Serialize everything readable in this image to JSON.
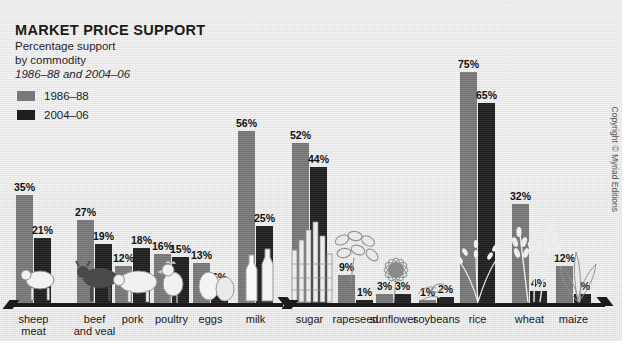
{
  "header": {
    "title": "MARKET PRICE SUPPORT",
    "subtitle_line1": "Percentage support",
    "subtitle_line2": "by commodity",
    "subtitle_line3": "1986–88 and 2004–06"
  },
  "legend": {
    "entries": [
      {
        "label": "1986–88",
        "color": "#797979"
      },
      {
        "label": "2004–06",
        "color": "#1f1f1f"
      }
    ]
  },
  "copyright": "Copyright © Myriad Editions",
  "chart_data": {
    "type": "bar",
    "title": "MARKET PRICE SUPPORT",
    "subtitle": "Percentage support by commodity, 1986–88 and 2004–06",
    "xlabel": "",
    "ylabel": "Percentage support",
    "ylim": [
      0,
      75
    ],
    "grid": false,
    "legend_position": "top-left",
    "unit": "%",
    "categories": [
      "sheep meat",
      "beef and veal",
      "pork",
      "poultry",
      "eggs",
      "milk",
      "sugar",
      "rapeseed",
      "sunflower",
      "soybeans",
      "rice",
      "wheat",
      "maize"
    ],
    "series": [
      {
        "name": "1986–88",
        "color": "#797979",
        "values": [
          35,
          27,
          12,
          16,
          13,
          56,
          52,
          9,
          3,
          1,
          75,
          32,
          12
        ]
      },
      {
        "name": "2004–06",
        "color": "#1f1f1f",
        "values": [
          21,
          19,
          18,
          15,
          6,
          25,
          44,
          1,
          3,
          2,
          65,
          4,
          3
        ]
      }
    ],
    "value_labels": [
      [
        "35%",
        "21%"
      ],
      [
        "27%",
        "19%"
      ],
      [
        "12%",
        "18%"
      ],
      [
        "16%",
        "15%"
      ],
      [
        "13%",
        "6%"
      ],
      [
        "56%",
        "25%"
      ],
      [
        "52%",
        "44%"
      ],
      [
        "9%",
        "1%"
      ],
      [
        "3%",
        "3%"
      ],
      [
        "1%",
        "2%"
      ],
      [
        "75%",
        "65%"
      ],
      [
        "32%",
        "4%"
      ],
      [
        "12%",
        "3%"
      ]
    ],
    "category_labels": [
      [
        "sheep",
        "meat"
      ],
      [
        "beef",
        "and veal"
      ],
      [
        "pork",
        ""
      ],
      [
        "poultry",
        ""
      ],
      [
        "eggs",
        ""
      ],
      [
        "milk",
        ""
      ],
      [
        "sugar",
        ""
      ],
      [
        "rapeseed",
        ""
      ],
      [
        "sunflower",
        ""
      ],
      [
        "soybeans",
        ""
      ],
      [
        "rice",
        ""
      ],
      [
        "wheat",
        ""
      ],
      [
        "maize",
        ""
      ]
    ],
    "group_icons": [
      "sheep-icon",
      "cow-icon",
      "pig-icon",
      "chicken-icon",
      "eggs-icon",
      "milk-bottle-icon",
      "sugarcane-icon",
      "rapeseed-icon",
      "sunflower-icon",
      "soybean-icon",
      "rice-plant-icon",
      "wheat-icon",
      "maize-icon"
    ]
  }
}
